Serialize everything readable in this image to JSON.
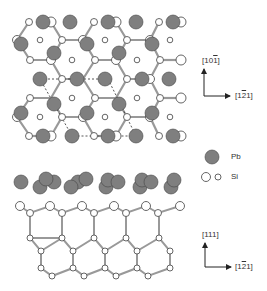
{
  "colors": {
    "pb": "#7f7f7f",
    "pb_stroke": "#444444",
    "si_fill": "#ffffff",
    "si_stroke": "#555555",
    "bond": "#999999"
  },
  "top_view": {
    "axes": {
      "vertical_label": "[10̅1]",
      "horizontal_label": "[1̅2 1]"
    },
    "vertical_parts": [
      "[10",
      "1",
      "]"
    ],
    "horizontal_parts": [
      "[1",
      "2",
      "1]"
    ]
  },
  "legend": {
    "items": [
      {
        "symbol": "large-gray-circle",
        "label": "Pb"
      },
      {
        "symbol": "open-circles-large-small",
        "label": "Si"
      }
    ]
  },
  "side_view": {
    "vertical_parts": [
      "[111]"
    ],
    "horizontal_parts": [
      "[1",
      "2",
      "1]"
    ]
  }
}
